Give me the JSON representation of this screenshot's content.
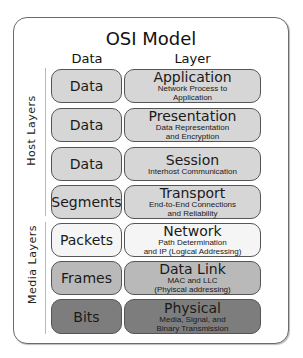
{
  "title": "OSI Model",
  "columns": {
    "data": "Data",
    "layer": "Layer"
  },
  "groups": {
    "host": "Host Layers",
    "media": "Media Layers"
  },
  "colors": {
    "light": "#d6d6d6",
    "white": "#f5f5f5",
    "medium": "#b9b9b9",
    "dark": "#7d7d7d",
    "border": "#555555"
  },
  "layers": [
    {
      "data": "Data",
      "name": "Application",
      "desc1": "Network Process to",
      "desc2": "Application",
      "group": "host"
    },
    {
      "data": "Data",
      "name": "Presentation",
      "desc1": "Data Representation",
      "desc2": "and Encryption",
      "group": "host"
    },
    {
      "data": "Data",
      "name": "Session",
      "desc1": "Interhost Communication",
      "desc2": "",
      "group": "host"
    },
    {
      "data": "Segments",
      "name": "Transport",
      "desc1": "End-to-End Connections",
      "desc2": "and Reliability",
      "group": "host"
    },
    {
      "data": "Packets",
      "name": "Network",
      "desc1": "Path Determination",
      "desc2": "and IP (Logical Addressing)",
      "group": "media"
    },
    {
      "data": "Frames",
      "name": "Data Link",
      "desc1": "MAC and LLC",
      "desc2": "(Phyiscal addressing)",
      "group": "media"
    },
    {
      "data": "Bits",
      "name": "Physical",
      "desc1": "Media, Signal, and",
      "desc2": "Binary Transmission",
      "group": "media"
    }
  ]
}
